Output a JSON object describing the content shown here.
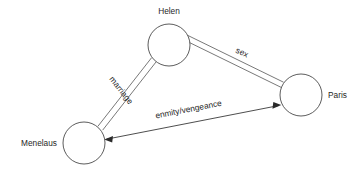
{
  "diagram": {
    "type": "node-link-graph",
    "background_color": "#ffffff",
    "stroke_color": "#555555",
    "text_color": "#1f1f1f",
    "nodes": [
      {
        "id": "helen",
        "label": "Helen",
        "cx": 169,
        "cy": 45,
        "r": 21,
        "label_x": 169,
        "label_y": 14,
        "label_anchor": "middle"
      },
      {
        "id": "paris",
        "label": "Paris",
        "cx": 301,
        "cy": 95,
        "r": 21,
        "label_x": 328,
        "label_y": 98,
        "label_anchor": "start"
      },
      {
        "id": "menelaus",
        "label": "Menelaus",
        "cx": 84,
        "cy": 143,
        "r": 21,
        "label_x": 57,
        "label_y": 146,
        "label_anchor": "end"
      }
    ],
    "edges": [
      {
        "id": "marriage",
        "label": "marriage",
        "from": "helen",
        "to": "menelaus",
        "style": "double-line",
        "arrows": "none",
        "label_x": 119,
        "label_y": 92,
        "label_rotation": 45
      },
      {
        "id": "sex",
        "label": "sex",
        "from": "helen",
        "to": "paris",
        "style": "double-line",
        "arrows": "none",
        "label_x": 241,
        "label_y": 56,
        "label_rotation": 20
      },
      {
        "id": "enmity-vengeance",
        "label": "enmity/vengeance",
        "from": "menelaus",
        "to": "paris",
        "style": "single-line",
        "arrows": "both",
        "label_x": 189,
        "label_y": 113,
        "label_rotation": -11
      }
    ]
  }
}
